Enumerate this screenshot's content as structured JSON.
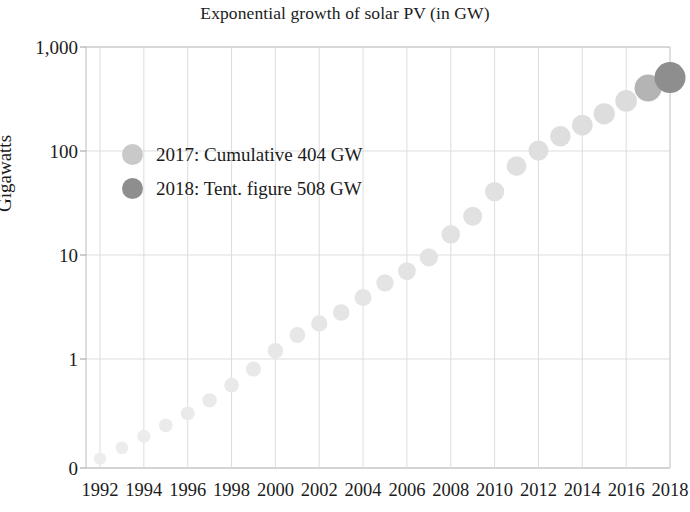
{
  "chart_data": {
    "type": "scatter",
    "title": "Exponential growth of solar PV (in GW)",
    "xlabel": "",
    "ylabel": "Gigawatts",
    "yscale": "log",
    "grid": true,
    "legend_position": "inside-upper-left",
    "ylim": [
      0.1,
      1000
    ],
    "xlim": [
      1991.5,
      2018.5
    ],
    "ytick_labels": [
      "1,000",
      "100",
      "10",
      "1",
      "0"
    ],
    "ytick_values": [
      1000,
      100,
      10,
      1,
      0
    ],
    "xtick_labels": [
      "1992",
      "1994",
      "1996",
      "1998",
      "2000",
      "2002",
      "2004",
      "2006",
      "2008",
      "2010",
      "2012",
      "2014",
      "2016",
      "2018"
    ],
    "xtick_values": [
      1992,
      1994,
      1996,
      1998,
      2000,
      2002,
      2004,
      2006,
      2008,
      2010,
      2012,
      2014,
      2016,
      2018
    ],
    "x": [
      1992,
      1993,
      1994,
      1995,
      1996,
      1997,
      1998,
      1999,
      2000,
      2001,
      2002,
      2003,
      2004,
      2005,
      2006,
      2007,
      2008,
      2009,
      2010,
      2011,
      2012,
      2013,
      2014,
      2015,
      2016,
      2017,
      2018
    ],
    "values": [
      0.11,
      0.14,
      0.18,
      0.23,
      0.3,
      0.4,
      0.56,
      0.8,
      1.2,
      1.7,
      2.2,
      2.8,
      3.9,
      5.4,
      7.0,
      9.5,
      15.8,
      23.6,
      40.7,
      71.5,
      100.9,
      138.9,
      177.0,
      228.0,
      303.0,
      404.0,
      508.0
    ],
    "series_name": "Cumulative installed solar PV capacity",
    "highlight_points": [
      {
        "year": 2017,
        "value": 404,
        "label": "2017: Cumulative 404 GW",
        "color": "#b4b4b4"
      },
      {
        "year": 2018,
        "value": 508,
        "label": "2018: Tent. figure 508 GW",
        "color": "#8e8e8e"
      }
    ],
    "marker_color_base": "#ececed",
    "grid_color": "#d9d9d9",
    "axis_color": "#b9b9b9",
    "text_color": "#1b1b1b"
  },
  "legend": {
    "items": [
      {
        "label": "2017: Cumulative 404 GW",
        "color": "#c9c9ca"
      },
      {
        "label": "2018: Tent. figure 508 GW",
        "color": "#8e8e8e"
      }
    ]
  }
}
